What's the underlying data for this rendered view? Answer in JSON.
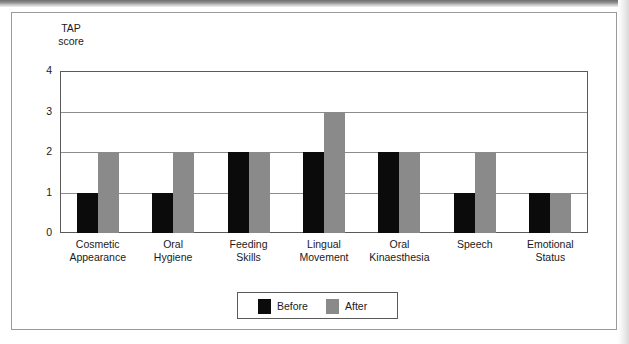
{
  "chart_data": {
    "type": "bar",
    "title": "",
    "xlabel": "",
    "ylabel": "TAP\nscore",
    "ylim": [
      0,
      4
    ],
    "yticks": [
      "0",
      "1",
      "2",
      "3",
      "4"
    ],
    "grid": true,
    "legend_position": "bottom-center",
    "categories": [
      "Cosmetic\nAppearance",
      "Oral\nHygiene",
      "Feeding\nSkills",
      "Lingual\nMovement",
      "Oral\nKinaesthesia",
      "Speech",
      "Emotional\nStatus"
    ],
    "series": [
      {
        "name": "Before",
        "color": "#0b0b0b",
        "values": [
          1,
          1,
          2,
          2,
          2,
          1,
          1
        ]
      },
      {
        "name": "After",
        "color": "#8a8a8a",
        "values": [
          2,
          2,
          2,
          3,
          2,
          2,
          1
        ]
      }
    ]
  },
  "legend": {
    "items": [
      {
        "label": "Before",
        "color": "#0b0b0b"
      },
      {
        "label": "After",
        "color": "#8a8a8a"
      }
    ]
  }
}
